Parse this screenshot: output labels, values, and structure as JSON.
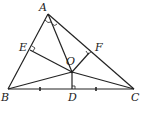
{
  "diagram": {
    "type": "geometry-triangle",
    "points": {
      "A": {
        "label": "A",
        "x": 48,
        "y": 14,
        "lx": 39,
        "ly": 11
      },
      "B": {
        "label": "B",
        "x": 8,
        "y": 89,
        "lx": 1,
        "ly": 101
      },
      "C": {
        "label": "C",
        "x": 134,
        "y": 89,
        "lx": 131,
        "ly": 101
      },
      "D": {
        "label": "D",
        "x": 72,
        "y": 89,
        "lx": 68,
        "ly": 101
      },
      "E": {
        "label": "E",
        "x": 30,
        "y": 50,
        "lx": 19,
        "ly": 51
      },
      "F": {
        "label": "F",
        "x": 89,
        "y": 53,
        "lx": 95,
        "ly": 51
      },
      "O": {
        "label": "O",
        "x": 72,
        "y": 72,
        "lx": 66,
        "ly": 65
      }
    },
    "segments": [
      "AB",
      "BC",
      "CA",
      "AO",
      "BO",
      "CO",
      "OD",
      "OE",
      "OF"
    ],
    "right_angles": [
      "E",
      "F",
      "D"
    ],
    "angle_marks": [
      "BAO",
      "OAC"
    ],
    "tick_marks": [
      "BD",
      "DC"
    ],
    "stroke_color": "#222222"
  }
}
